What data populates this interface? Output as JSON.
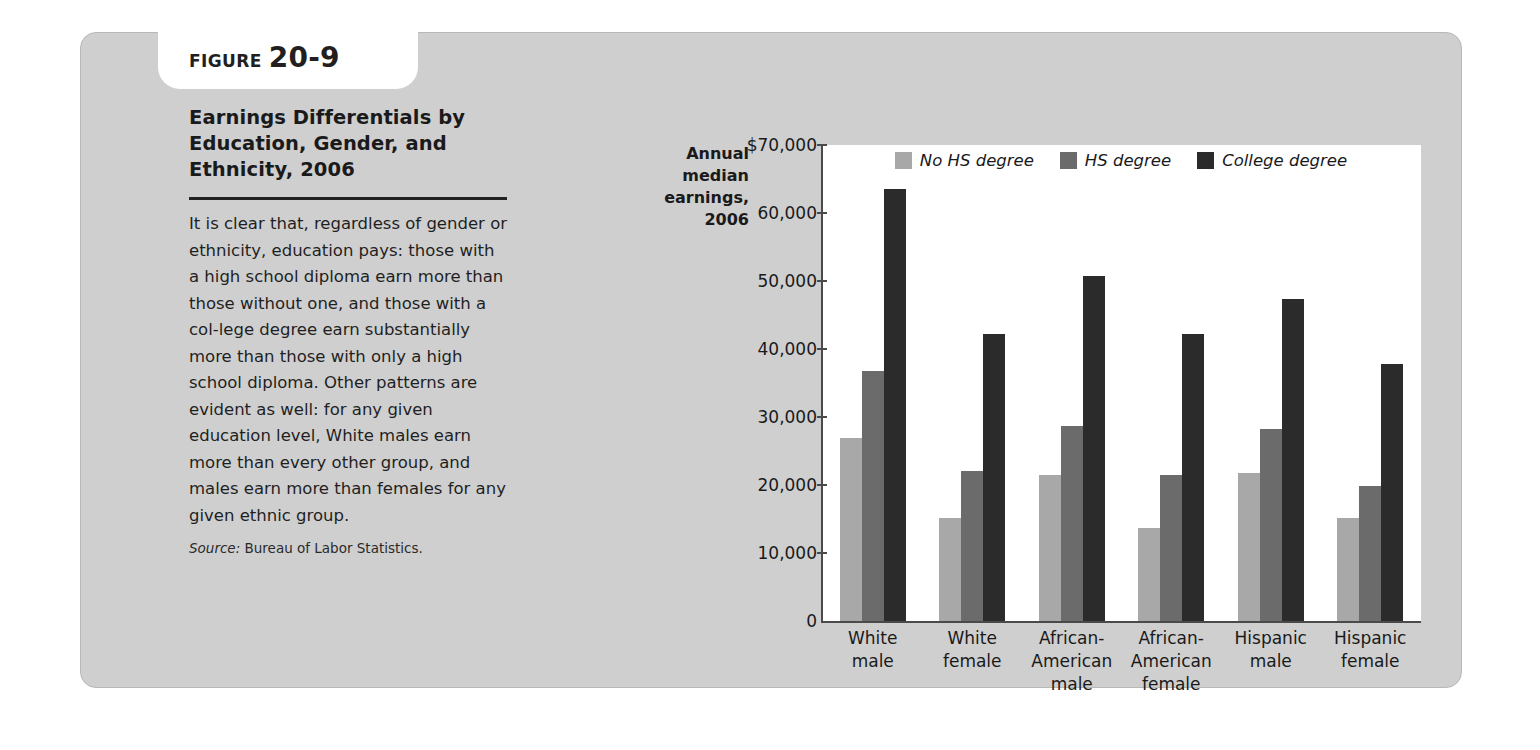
{
  "figure": {
    "tab_word": "FIGURE",
    "tab_number": "20-9",
    "title": "Earnings Differentials by Education, Gender, and Ethnicity, 2006",
    "body": "It is clear that, regardless of gender or ethnicity, education pays: those with a high school diploma earn more than those without one, and those with a col-lege degree earn substantially more than those with only a high school diploma. Other patterns are evident as well: for any given education level, White males earn more than every other group, and males earn more than females for any given ethnic group.",
    "source_label": "Source:",
    "source_text": "Bureau of Labor Statistics."
  },
  "colors": {
    "panel_background": "#cfcfcf",
    "plot_background": "#ffffff",
    "axis": "#4a4a4a",
    "no_hs_degree": "#a8a8a8",
    "hs_degree": "#6b6b6b",
    "college_degree": "#2b2b2b"
  },
  "chart_data": {
    "type": "bar",
    "title": "Earnings Differentials by Education, Gender, and Ethnicity, 2006",
    "ylabel": "Annual median earnings, 2006",
    "xlabel": "",
    "ylim": [
      0,
      70000
    ],
    "grid": false,
    "legend_position": "top-center",
    "categories": [
      "White male",
      "White female",
      "African-American male",
      "African-American female",
      "Hispanic male",
      "Hispanic female"
    ],
    "category_lines": [
      [
        "White",
        "male"
      ],
      [
        "White",
        "female"
      ],
      [
        "African-",
        "American",
        "male"
      ],
      [
        "African-",
        "American",
        "female"
      ],
      [
        "Hispanic",
        "male"
      ],
      [
        "Hispanic",
        "female"
      ]
    ],
    "ytick_values": [
      70000,
      60000,
      50000,
      40000,
      30000,
      20000,
      10000,
      0
    ],
    "ytick_labels": [
      "$70,000",
      "60,000",
      "50,000",
      "40,000",
      "30,000",
      "20,000",
      "10,000",
      "0"
    ],
    "series": [
      {
        "name": "No HS degree",
        "color": "#a8a8a8",
        "values": [
          26900,
          15200,
          21500,
          13700,
          21800,
          15100
        ]
      },
      {
        "name": "HS degree",
        "color": "#6b6b6b",
        "values": [
          36700,
          22000,
          28700,
          21400,
          28200,
          19900
        ]
      },
      {
        "name": "College degree",
        "color": "#2b2b2b",
        "values": [
          63600,
          42200,
          50700,
          42200,
          47300,
          37800
        ]
      }
    ]
  }
}
